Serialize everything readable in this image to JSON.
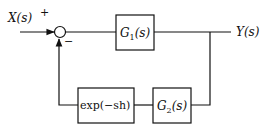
{
  "diagram": {
    "type": "feedback-control-block-diagram",
    "input": {
      "label": "X(s)",
      "sign": "+"
    },
    "feedback_sign": "−",
    "forward_block": {
      "label_main": "G",
      "label_sub": "1",
      "label_arg": "(s)"
    },
    "output": {
      "label": "Y(s)"
    },
    "feedback_blocks": [
      {
        "label": "exp(−sh)"
      },
      {
        "label_main": "G",
        "label_sub": "2",
        "label_arg": "(s)"
      }
    ],
    "colors": {
      "line": "#111111",
      "background": "#ffffff"
    }
  }
}
